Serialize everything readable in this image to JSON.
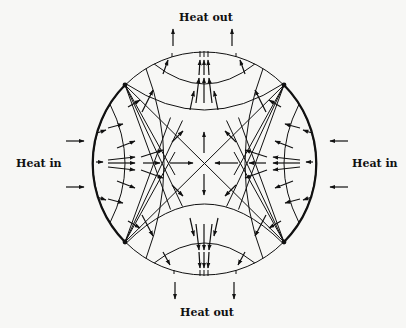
{
  "diagram": {
    "labels": {
      "top": "Heat out",
      "bottom": "Heat out",
      "left": "Heat in",
      "right": "Heat in"
    },
    "geometry": {
      "cx": 204.5,
      "cy": 163.5,
      "r": 111.5
    },
    "colors": {
      "background": "#f7f7f5",
      "ink": "#111111"
    },
    "corner_points": [
      {
        "x": 125,
        "y": 85
      },
      {
        "x": 284,
        "y": 85
      },
      {
        "x": 125,
        "y": 242
      },
      {
        "x": 284,
        "y": 242
      }
    ],
    "external_arrows": {
      "heat_out_top": [
        {
          "x": 173
        },
        {
          "x": 232
        }
      ],
      "heat_out_bottom": [
        {
          "x": 175
        },
        {
          "x": 234
        }
      ],
      "heat_in_left": [
        {
          "y": 141
        },
        {
          "y": 187
        }
      ],
      "heat_in_right": [
        {
          "y": 141
        },
        {
          "y": 187
        }
      ]
    }
  }
}
